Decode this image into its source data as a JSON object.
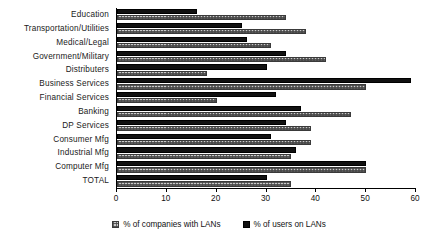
{
  "chart_data": {
    "type": "bar",
    "orientation": "horizontal",
    "title": "",
    "xlabel": "",
    "ylabel": "",
    "xlim": [
      0,
      60
    ],
    "xticks": [
      0,
      10,
      20,
      30,
      40,
      50,
      60
    ],
    "xtick_labels": [
      "0",
      "10",
      "20",
      "30",
      "40",
      "50",
      "60"
    ],
    "grid": false,
    "legend_position": "bottom-center",
    "categories": [
      "Education",
      "Transportation/Utilities",
      "Medical/Legal",
      "Government/Military",
      "Distributers",
      "Business Services",
      "Financial Services",
      "Banking",
      "DP Services",
      "Consumer Mfg",
      "Industrial Mfg",
      "Computer Mfg",
      "TOTAL"
    ],
    "series": [
      {
        "name": "% of users on LANs",
        "color": "#111111",
        "style": "solid",
        "values": [
          16,
          25,
          26,
          34,
          30,
          59,
          32,
          37,
          34,
          31,
          36,
          50,
          30
        ]
      },
      {
        "name": "% of companies with LANs",
        "color": "#c9c9c9",
        "style": "hatched",
        "values": [
          34,
          38,
          31,
          42,
          18,
          50,
          20,
          47,
          39,
          39,
          35,
          50,
          35
        ]
      }
    ],
    "legend": [
      "% of companies with LANs",
      "% of users on LANs"
    ]
  }
}
